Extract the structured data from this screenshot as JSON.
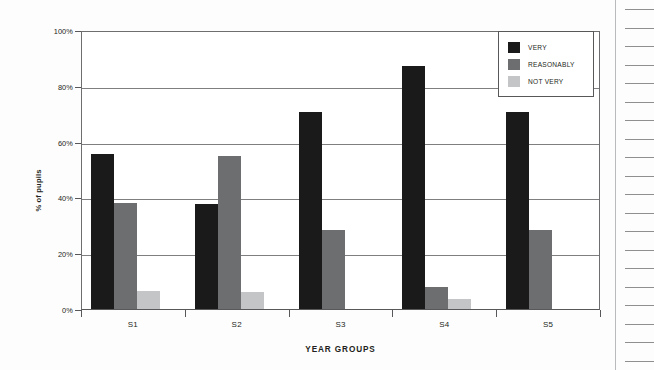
{
  "chart_data": {
    "type": "bar",
    "title": "",
    "subtitle": "",
    "xlabel": "YEAR GROUPS",
    "ylabel": "% of pupils",
    "categories": [
      "S1",
      "S2",
      "S3",
      "S4",
      "S5"
    ],
    "series": [
      {
        "name": "VERY",
        "color": "#1a1a1a",
        "values": [
          55.5,
          37.5,
          70.5,
          87.0,
          70.5
        ]
      },
      {
        "name": "REASONABLY",
        "color": "#6d6e70",
        "values": [
          38.0,
          55.0,
          28.5,
          8.0,
          28.5
        ]
      },
      {
        "name": "NOT VERY",
        "color": "#c4c5c7",
        "values": [
          6.5,
          6.0,
          0.0,
          3.5,
          0.0
        ]
      }
    ],
    "ylim": [
      0,
      100
    ],
    "ytick_values": [
      0,
      20,
      40,
      60,
      80,
      100
    ],
    "ytick_labels": [
      "0%",
      "20%",
      "40%",
      "60%",
      "80%",
      "100%"
    ],
    "grid": true,
    "legend_position": "top-right"
  },
  "legend": {
    "entries": [
      {
        "label": "VERY",
        "color": "#1a1a1a"
      },
      {
        "label": "REASONABLY",
        "color": "#6d6e70"
      },
      {
        "label": "NOT VERY",
        "color": "#c4c5c7"
      }
    ]
  },
  "page": {
    "ruled_line_count": 20,
    "margin_rule_color": "#b9babc"
  }
}
